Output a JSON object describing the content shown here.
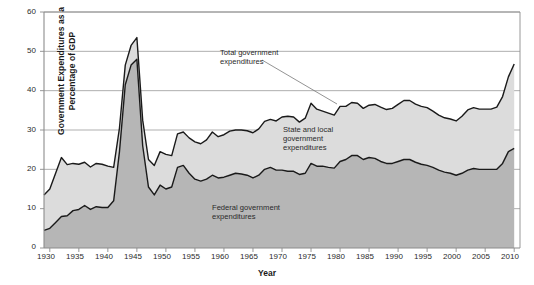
{
  "chart_data": {
    "type": "area",
    "title": "",
    "subtitle": "",
    "xlabel": "Year",
    "ylabel": "Government Expenditures as a Percentage of GDP",
    "xlim": [
      1929,
      2011
    ],
    "ylim": [
      0,
      60
    ],
    "ytick_labels": [
      "0",
      "10",
      "20",
      "30",
      "40",
      "50",
      "60"
    ],
    "ytick_values": [
      0,
      10,
      20,
      30,
      40,
      50,
      60
    ],
    "xtick_labels": [
      "1930",
      "1935",
      "1940",
      "1945",
      "1950",
      "1955",
      "1960",
      "1965",
      "1970",
      "1975",
      "1980",
      "1985",
      "1990",
      "1995",
      "2000",
      "2005",
      "2010"
    ],
    "xtick_values": [
      1930,
      1935,
      1940,
      1945,
      1950,
      1955,
      1960,
      1965,
      1970,
      1975,
      1980,
      1985,
      1990,
      1995,
      2000,
      2005,
      2010
    ],
    "grid": "horizontal",
    "legend_position": "inline-annotations",
    "stacked": true,
    "colors": {
      "federal_fill": "#b6b6b6",
      "state_local_fill": "#dcdcdc",
      "line": "#1a1a1a",
      "axis": "#8c8c8c",
      "grid": "#8c8c8c",
      "background": "#ffffff"
    },
    "annotations": [
      {
        "name": "total-government-expenditures",
        "text_lines": [
          "Total government",
          "expenditures"
        ],
        "leader_line": true
      },
      {
        "name": "state-and-local-government-expenditures",
        "text_lines": [
          "State and local",
          "government",
          "expenditures"
        ],
        "leader_line": false
      },
      {
        "name": "federal-government-expenditures",
        "text_lines": [
          "Federal government",
          "expenditures"
        ],
        "leader_line": false
      }
    ],
    "x": [
      1929,
      1930,
      1931,
      1932,
      1933,
      1934,
      1935,
      1936,
      1937,
      1938,
      1939,
      1940,
      1941,
      1942,
      1943,
      1944,
      1945,
      1946,
      1947,
      1948,
      1949,
      1950,
      1951,
      1952,
      1953,
      1954,
      1955,
      1956,
      1957,
      1958,
      1959,
      1960,
      1961,
      1962,
      1963,
      1964,
      1965,
      1966,
      1967,
      1968,
      1969,
      1970,
      1971,
      1972,
      1973,
      1974,
      1975,
      1976,
      1977,
      1978,
      1979,
      1980,
      1981,
      1982,
      1983,
      1984,
      1985,
      1986,
      1987,
      1988,
      1989,
      1990,
      1991,
      1992,
      1993,
      1994,
      1995,
      1996,
      1997,
      1998,
      1999,
      2000,
      2001,
      2002,
      2003,
      2004,
      2005,
      2006,
      2007,
      2008,
      2009,
      2010
    ],
    "series": [
      {
        "name": "Federal government expenditures",
        "values": [
          4.5,
          5.0,
          6.5,
          8.0,
          8.2,
          9.5,
          9.8,
          10.8,
          9.8,
          10.5,
          10.3,
          10.3,
          12.0,
          24.5,
          41.5,
          46.5,
          48.0,
          26.0,
          15.5,
          13.5,
          16.0,
          15.0,
          15.5,
          20.5,
          21.0,
          19.0,
          17.5,
          17.0,
          17.5,
          18.5,
          17.8,
          18.0,
          18.5,
          19.0,
          18.8,
          18.5,
          17.8,
          18.5,
          20.0,
          20.5,
          19.8,
          19.8,
          19.5,
          19.5,
          18.7,
          19.0,
          21.5,
          20.8,
          20.8,
          20.5,
          20.3,
          22.0,
          22.5,
          23.5,
          23.5,
          22.5,
          23.0,
          22.8,
          22.0,
          21.5,
          21.5,
          22.0,
          22.5,
          22.5,
          21.8,
          21.3,
          21.0,
          20.5,
          19.8,
          19.3,
          19.0,
          18.5,
          19.0,
          19.8,
          20.2,
          20.0,
          20.0,
          20.0,
          20.0,
          21.5,
          24.5,
          25.3
        ]
      },
      {
        "name": "State and local government expenditures",
        "values": [
          9.0,
          10.0,
          12.5,
          15.0,
          13.0,
          12.0,
          11.5,
          11.0,
          10.8,
          11.0,
          11.0,
          10.5,
          8.5,
          6.0,
          5.0,
          5.0,
          5.5,
          6.5,
          7.0,
          7.5,
          8.5,
          8.8,
          8.0,
          8.5,
          8.5,
          9.0,
          9.5,
          9.5,
          10.0,
          11.0,
          10.5,
          10.8,
          11.2,
          11.0,
          11.2,
          11.3,
          11.5,
          11.8,
          12.2,
          12.2,
          12.5,
          13.5,
          14.0,
          13.8,
          13.3,
          14.0,
          15.3,
          14.5,
          14.0,
          13.8,
          13.5,
          14.0,
          13.5,
          13.5,
          13.3,
          13.0,
          13.3,
          13.7,
          13.8,
          13.7,
          14.0,
          14.5,
          15.0,
          15.0,
          14.8,
          14.7,
          14.7,
          14.3,
          14.0,
          13.8,
          13.8,
          13.8,
          14.5,
          15.3,
          15.5,
          15.3,
          15.3,
          15.3,
          15.8,
          17.0,
          19.0,
          21.5
        ]
      }
    ],
    "total_series": {
      "name": "Total government expenditures",
      "values": [
        13.5,
        15.0,
        19.0,
        23.0,
        21.2,
        21.5,
        21.3,
        21.8,
        20.6,
        21.5,
        21.3,
        20.8,
        20.5,
        30.5,
        46.5,
        51.5,
        53.5,
        32.5,
        22.5,
        21.0,
        24.5,
        23.8,
        23.5,
        29.0,
        29.5,
        28.0,
        27.0,
        26.5,
        27.5,
        29.5,
        28.3,
        28.8,
        29.7,
        30.0,
        30.0,
        29.8,
        29.3,
        30.3,
        32.2,
        32.7,
        32.3,
        33.3,
        33.5,
        33.3,
        32.0,
        33.0,
        36.8,
        35.3,
        34.8,
        34.3,
        33.8,
        36.0,
        36.0,
        37.0,
        36.8,
        35.5,
        36.3,
        36.5,
        35.8,
        35.2,
        35.5,
        36.5,
        37.5,
        37.5,
        36.6,
        36.0,
        35.7,
        34.8,
        33.8,
        33.1,
        32.8,
        32.3,
        33.5,
        35.1,
        35.7,
        35.3,
        35.3,
        35.3,
        35.8,
        38.5,
        43.5,
        46.8
      ]
    }
  }
}
